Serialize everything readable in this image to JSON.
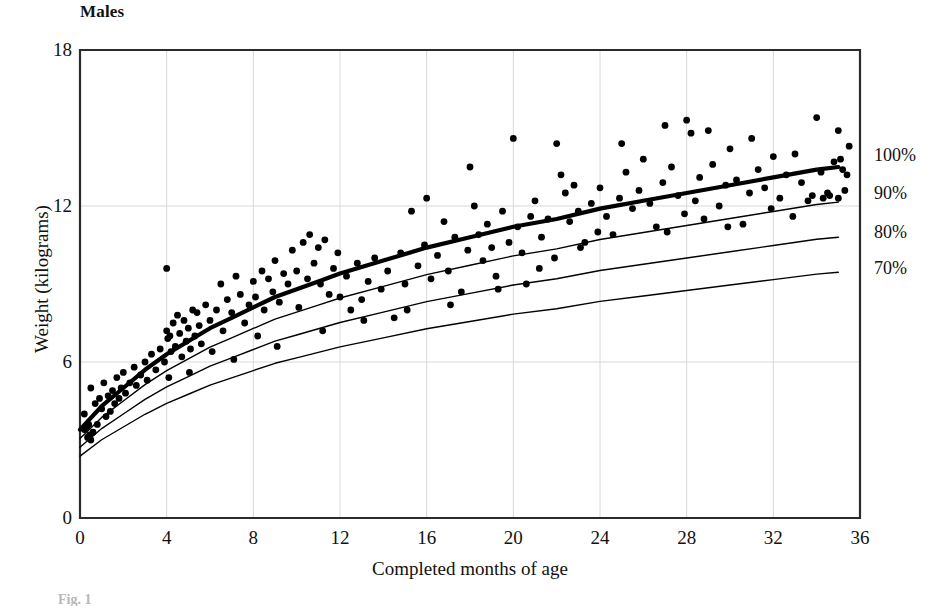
{
  "chart_data": {
    "type": "scatter",
    "title": "Males",
    "xlabel": "Completed months of age",
    "ylabel": "Weight (kilograms)",
    "xlim": [
      0,
      36
    ],
    "ylim": [
      0,
      18
    ],
    "xticks": [
      0,
      4,
      8,
      12,
      16,
      20,
      24,
      28,
      32,
      36
    ],
    "yticks": [
      0,
      6,
      12,
      18
    ],
    "grid": true,
    "legend_position": "right-outside",
    "x_unit": "months",
    "y_unit": "kilograms",
    "reference_curves": [
      {
        "name": "100%",
        "label": "100%",
        "emphasis": "thick",
        "label_y_kg": 13.95,
        "x": [
          0,
          1,
          2,
          3,
          4,
          5,
          6,
          7,
          8,
          9,
          10,
          11,
          12,
          14,
          16,
          18,
          20,
          22,
          24,
          26,
          28,
          30,
          32,
          34,
          35
        ],
        "y": [
          3.4,
          4.3,
          5.0,
          5.7,
          6.3,
          6.8,
          7.3,
          7.7,
          8.1,
          8.5,
          8.8,
          9.1,
          9.4,
          9.9,
          10.4,
          10.8,
          11.2,
          11.5,
          11.9,
          12.2,
          12.5,
          12.8,
          13.1,
          13.4,
          13.5
        ]
      },
      {
        "name": "90%",
        "label": "90%",
        "emphasis": "thin",
        "label_y_kg": 12.5,
        "x": [
          0,
          1,
          2,
          3,
          4,
          5,
          6,
          7,
          8,
          9,
          10,
          11,
          12,
          14,
          16,
          18,
          20,
          22,
          24,
          26,
          28,
          30,
          32,
          34,
          35
        ],
        "y": [
          3.06,
          3.87,
          4.5,
          5.13,
          5.67,
          6.12,
          6.57,
          6.93,
          7.29,
          7.65,
          7.92,
          8.19,
          8.46,
          8.91,
          9.36,
          9.72,
          10.08,
          10.35,
          10.71,
          10.98,
          11.25,
          11.52,
          11.79,
          12.06,
          12.15
        ]
      },
      {
        "name": "80%",
        "label": "80%",
        "emphasis": "thin",
        "label_y_kg": 11.0,
        "x": [
          0,
          1,
          2,
          3,
          4,
          5,
          6,
          7,
          8,
          9,
          10,
          11,
          12,
          14,
          16,
          18,
          20,
          22,
          24,
          26,
          28,
          30,
          32,
          34,
          35
        ],
        "y": [
          2.72,
          3.44,
          4.0,
          4.56,
          5.04,
          5.44,
          5.84,
          6.16,
          6.48,
          6.8,
          7.04,
          7.28,
          7.52,
          7.92,
          8.32,
          8.64,
          8.96,
          9.2,
          9.52,
          9.76,
          10.0,
          10.24,
          10.48,
          10.72,
          10.8
        ]
      },
      {
        "name": "70%",
        "label": "70%",
        "emphasis": "thin",
        "label_y_kg": 9.6,
        "x": [
          0,
          1,
          2,
          3,
          4,
          5,
          6,
          7,
          8,
          9,
          10,
          11,
          12,
          14,
          16,
          18,
          20,
          22,
          24,
          26,
          28,
          30,
          32,
          34,
          35
        ],
        "y": [
          2.38,
          3.01,
          3.5,
          3.99,
          4.41,
          4.76,
          5.11,
          5.39,
          5.67,
          5.95,
          6.16,
          6.37,
          6.58,
          6.93,
          7.28,
          7.56,
          7.84,
          8.05,
          8.33,
          8.54,
          8.75,
          8.96,
          9.17,
          9.38,
          9.45
        ]
      }
    ],
    "series": [
      {
        "name": "Individual boys",
        "marker": "filled-circle",
        "color": "#000000",
        "points": [
          [
            0.2,
            4.0
          ],
          [
            0.2,
            3.4
          ],
          [
            0.3,
            3.5
          ],
          [
            0.35,
            3.1
          ],
          [
            0.4,
            3.6
          ],
          [
            0.45,
            3.2
          ],
          [
            0.5,
            3.0
          ],
          [
            0.5,
            5.0
          ],
          [
            0.6,
            3.3
          ],
          [
            0.7,
            4.4
          ],
          [
            0.8,
            3.6
          ],
          [
            0.9,
            4.6
          ],
          [
            1.0,
            4.2
          ],
          [
            1.1,
            5.2
          ],
          [
            1.2,
            3.9
          ],
          [
            1.3,
            4.7
          ],
          [
            1.4,
            4.1
          ],
          [
            1.5,
            4.9
          ],
          [
            1.6,
            4.4
          ],
          [
            1.7,
            5.4
          ],
          [
            1.8,
            4.6
          ],
          [
            1.9,
            5.0
          ],
          [
            2.0,
            5.6
          ],
          [
            2.1,
            4.8
          ],
          [
            2.3,
            5.2
          ],
          [
            2.5,
            5.8
          ],
          [
            2.6,
            5.1
          ],
          [
            2.8,
            5.5
          ],
          [
            3.0,
            6.0
          ],
          [
            3.1,
            5.3
          ],
          [
            3.3,
            6.3
          ],
          [
            3.5,
            5.7
          ],
          [
            3.7,
            6.5
          ],
          [
            3.9,
            6.0
          ],
          [
            4.0,
            9.6
          ],
          [
            4.0,
            7.2
          ],
          [
            4.05,
            6.9
          ],
          [
            4.1,
            5.4
          ],
          [
            4.15,
            7.0
          ],
          [
            4.2,
            6.4
          ],
          [
            4.3,
            7.5
          ],
          [
            4.4,
            6.6
          ],
          [
            4.5,
            7.8
          ],
          [
            4.6,
            7.1
          ],
          [
            4.7,
            6.2
          ],
          [
            4.8,
            7.6
          ],
          [
            4.9,
            6.8
          ],
          [
            5.0,
            7.3
          ],
          [
            5.1,
            6.5
          ],
          [
            5.2,
            8.0
          ],
          [
            5.3,
            7.0
          ],
          [
            5.4,
            7.9
          ],
          [
            5.5,
            7.4
          ],
          [
            5.6,
            6.7
          ],
          [
            5.8,
            8.2
          ],
          [
            6.0,
            7.6
          ],
          [
            6.1,
            6.4
          ],
          [
            6.3,
            8.0
          ],
          [
            6.5,
            9.0
          ],
          [
            6.6,
            7.2
          ],
          [
            6.8,
            8.4
          ],
          [
            7.0,
            7.9
          ],
          [
            7.2,
            9.3
          ],
          [
            7.4,
            8.6
          ],
          [
            7.6,
            7.5
          ],
          [
            7.8,
            8.2
          ],
          [
            8.0,
            9.1
          ],
          [
            8.1,
            8.5
          ],
          [
            8.2,
            7.0
          ],
          [
            8.4,
            9.5
          ],
          [
            8.5,
            8.0
          ],
          [
            8.7,
            9.2
          ],
          [
            8.9,
            8.7
          ],
          [
            9.0,
            9.9
          ],
          [
            9.2,
            8.3
          ],
          [
            9.4,
            9.4
          ],
          [
            9.6,
            9.0
          ],
          [
            9.8,
            10.3
          ],
          [
            10.0,
            9.5
          ],
          [
            10.1,
            8.1
          ],
          [
            10.3,
            10.6
          ],
          [
            10.5,
            9.2
          ],
          [
            10.6,
            10.9
          ],
          [
            10.8,
            9.8
          ],
          [
            11.0,
            10.4
          ],
          [
            11.1,
            9.0
          ],
          [
            11.3,
            10.7
          ],
          [
            11.5,
            8.6
          ],
          [
            11.7,
            9.6
          ],
          [
            11.9,
            10.2
          ],
          [
            12.0,
            8.5
          ],
          [
            12.3,
            9.3
          ],
          [
            12.5,
            8.0
          ],
          [
            12.8,
            9.8
          ],
          [
            13.0,
            8.4
          ],
          [
            13.3,
            9.1
          ],
          [
            13.6,
            10.0
          ],
          [
            13.9,
            8.8
          ],
          [
            14.2,
            9.5
          ],
          [
            14.5,
            7.7
          ],
          [
            14.8,
            10.2
          ],
          [
            15.0,
            9.0
          ],
          [
            15.3,
            11.8
          ],
          [
            15.6,
            9.7
          ],
          [
            15.9,
            10.5
          ],
          [
            16.0,
            12.3
          ],
          [
            16.2,
            9.2
          ],
          [
            16.5,
            10.1
          ],
          [
            16.8,
            11.4
          ],
          [
            17.0,
            9.5
          ],
          [
            17.3,
            10.8
          ],
          [
            17.6,
            8.7
          ],
          [
            17.9,
            10.3
          ],
          [
            18.0,
            13.5
          ],
          [
            18.2,
            12.0
          ],
          [
            18.4,
            10.9
          ],
          [
            18.6,
            9.9
          ],
          [
            18.8,
            11.3
          ],
          [
            19.0,
            10.4
          ],
          [
            19.2,
            9.3
          ],
          [
            19.5,
            11.8
          ],
          [
            19.8,
            10.6
          ],
          [
            20.0,
            14.6
          ],
          [
            20.2,
            11.2
          ],
          [
            20.4,
            10.2
          ],
          [
            20.6,
            9.0
          ],
          [
            20.8,
            11.6
          ],
          [
            21.0,
            12.2
          ],
          [
            21.3,
            10.8
          ],
          [
            21.6,
            11.5
          ],
          [
            21.9,
            10.0
          ],
          [
            22.0,
            14.4
          ],
          [
            22.2,
            13.2
          ],
          [
            22.4,
            12.5
          ],
          [
            22.6,
            11.4
          ],
          [
            22.8,
            12.8
          ],
          [
            23.0,
            11.8
          ],
          [
            23.3,
            10.6
          ],
          [
            23.6,
            12.1
          ],
          [
            23.9,
            11.0
          ],
          [
            24.0,
            12.7
          ],
          [
            24.3,
            11.6
          ],
          [
            24.6,
            10.9
          ],
          [
            24.9,
            12.3
          ],
          [
            25.0,
            14.4
          ],
          [
            25.2,
            13.3
          ],
          [
            25.5,
            11.9
          ],
          [
            25.8,
            12.6
          ],
          [
            26.0,
            13.8
          ],
          [
            26.3,
            12.1
          ],
          [
            26.6,
            11.2
          ],
          [
            26.9,
            12.9
          ],
          [
            27.0,
            15.1
          ],
          [
            27.3,
            13.5
          ],
          [
            27.6,
            12.4
          ],
          [
            27.9,
            11.7
          ],
          [
            28.0,
            15.3
          ],
          [
            28.2,
            14.8
          ],
          [
            28.4,
            12.2
          ],
          [
            28.6,
            13.1
          ],
          [
            28.8,
            11.5
          ],
          [
            29.0,
            14.9
          ],
          [
            29.2,
            13.6
          ],
          [
            29.5,
            12.0
          ],
          [
            29.8,
            12.8
          ],
          [
            30.0,
            14.2
          ],
          [
            30.3,
            13.0
          ],
          [
            30.6,
            11.3
          ],
          [
            30.9,
            12.5
          ],
          [
            31.0,
            14.6
          ],
          [
            31.3,
            13.4
          ],
          [
            31.6,
            12.7
          ],
          [
            31.9,
            11.9
          ],
          [
            32.0,
            13.9
          ],
          [
            32.3,
            12.3
          ],
          [
            32.6,
            13.2
          ],
          [
            32.9,
            11.6
          ],
          [
            33.0,
            14.0
          ],
          [
            33.3,
            12.9
          ],
          [
            33.6,
            12.2
          ],
          [
            34.0,
            15.4
          ],
          [
            34.2,
            13.3
          ],
          [
            34.5,
            12.5
          ],
          [
            34.8,
            13.7
          ],
          [
            35.0,
            14.9
          ],
          [
            35.1,
            13.8
          ],
          [
            35.2,
            13.4
          ],
          [
            35.3,
            12.6
          ],
          [
            35.4,
            13.2
          ],
          [
            35.5,
            14.3
          ],
          [
            35.0,
            12.3
          ],
          [
            34.6,
            12.4
          ],
          [
            34.3,
            12.3
          ],
          [
            33.8,
            12.4
          ],
          [
            29.9,
            11.2
          ],
          [
            27.1,
            11.0
          ],
          [
            23.1,
            10.4
          ],
          [
            21.2,
            9.6
          ],
          [
            19.3,
            8.8
          ],
          [
            17.1,
            8.2
          ],
          [
            15.1,
            8.0
          ],
          [
            13.1,
            7.6
          ],
          [
            11.2,
            7.2
          ],
          [
            9.1,
            6.6
          ],
          [
            7.1,
            6.1
          ],
          [
            5.05,
            5.6
          ]
        ]
      }
    ],
    "right_axis_labels": [
      "100%",
      "90%",
      "80%",
      "70%"
    ]
  },
  "caption": "Fig. 1",
  "plot_geometry": {
    "left_px": 80,
    "right_px": 860,
    "top_px": 50,
    "bottom_px": 518
  }
}
